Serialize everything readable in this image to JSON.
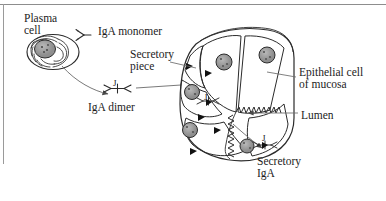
{
  "figure": {
    "background_color": "#ffffff",
    "ink_color": "#1c1c1c",
    "border_color": "#8d8d8d"
  },
  "labels": {
    "plasma_cell": "Plasma\ncell",
    "iga_monomer": "IgA monomer",
    "secretory_piece": "Secretory\npiece",
    "iga_dimer": "IgA dimer",
    "epithelial_cell": "Epithelial cell\nof mucosa",
    "lumen": "Lumen",
    "secretory_iga": "Secretory\nIgA",
    "j_chain_dimer": "J",
    "j_chain_intracellular": "J",
    "j_chain_secretory": "J"
  },
  "structures": {
    "plasma_cell_note": "oval cell with concentric rough ER whorls and stippled nucleus",
    "epithelial_cells_note": "wedge-shaped columnar cells radiating around central lumen",
    "microvilli_note": "zigzag brush border lining the lumen",
    "secretory_piece_note": "solid black triangles in epithelial cell membranes",
    "nucleus_count": 5,
    "secretory_piece_count": 5
  },
  "arrows": {
    "plasma_to_dimer": "curved arrow from plasma cell to IgA dimer",
    "dimer_to_epithelium": "arrow from IgA dimer into epithelial cell",
    "lumen_to_secretory_iga": "arrow from lumen to secretory IgA",
    "secretory_piece_leader": "leader line to membrane triangle",
    "epithelial_leader": "leader line into epithelial cell",
    "lumen_leader": "leader line to lumen"
  }
}
